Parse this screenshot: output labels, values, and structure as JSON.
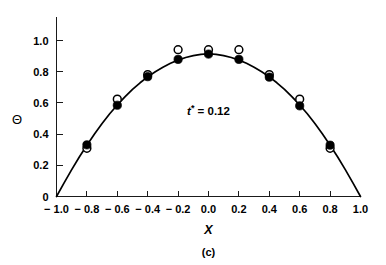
{
  "figure": {
    "caption": "(c)",
    "annotation": {
      "symbol": "t",
      "superscript": "*",
      "relation": "=",
      "value": "0.12",
      "full_text": "t* = 0.12"
    }
  },
  "chart_data": {
    "type": "scatter",
    "title": "",
    "subtitle": "",
    "xlabel": "X",
    "ylabel": "Θ",
    "xlim": [
      -1.0,
      1.0
    ],
    "ylim": [
      0.0,
      1.0
    ],
    "xticks": [
      -1.0,
      -0.8,
      -0.6,
      -0.4,
      -0.2,
      0.0,
      0.2,
      0.4,
      0.6,
      0.8,
      1.0
    ],
    "xtick_labels": [
      "− 1.0",
      "− 0.8",
      "− 0.6",
      "− 0.4",
      "− 0.2",
      "0.0",
      "0.2",
      "0.4",
      "0.6",
      "0.8",
      "1.0"
    ],
    "yticks": [
      0.0,
      0.2,
      0.4,
      0.6,
      0.8,
      1.0
    ],
    "ytick_labels": [
      "0",
      "0.2",
      "0.4",
      "0.6",
      "0.8",
      "1.0"
    ],
    "grid": false,
    "legend": "none",
    "annotations": [
      {
        "text": "t* = 0.12",
        "x": 0.0,
        "y": 0.52
      }
    ],
    "series": [
      {
        "name": "model-curve",
        "type": "line",
        "marker": "none",
        "color": "#000000",
        "x": [
          -1.0,
          -0.95,
          -0.9,
          -0.85,
          -0.8,
          -0.75,
          -0.7,
          -0.65,
          -0.6,
          -0.55,
          -0.5,
          -0.45,
          -0.4,
          -0.35,
          -0.3,
          -0.25,
          -0.2,
          -0.15,
          -0.1,
          -0.05,
          0.0,
          0.05,
          0.1,
          0.15,
          0.2,
          0.25,
          0.3,
          0.35,
          0.4,
          0.45,
          0.5,
          0.55,
          0.6,
          0.65,
          0.7,
          0.75,
          0.8,
          0.85,
          0.9,
          0.95,
          1.0
        ],
        "y": [
          0.0,
          0.087,
          0.172,
          0.253,
          0.329,
          0.401,
          0.468,
          0.53,
          0.587,
          0.639,
          0.687,
          0.729,
          0.767,
          0.8,
          0.829,
          0.854,
          0.874,
          0.891,
          0.903,
          0.911,
          0.915,
          0.911,
          0.903,
          0.891,
          0.874,
          0.854,
          0.829,
          0.8,
          0.767,
          0.729,
          0.687,
          0.639,
          0.587,
          0.53,
          0.468,
          0.401,
          0.329,
          0.253,
          0.172,
          0.087,
          0.0
        ]
      },
      {
        "name": "filled-circles",
        "type": "scatter",
        "marker": "filled-circle",
        "color": "#000000",
        "x": [
          -0.8,
          -0.6,
          -0.4,
          -0.2,
          0.0,
          0.2,
          0.4,
          0.6,
          0.8
        ],
        "y": [
          0.331,
          0.585,
          0.768,
          0.879,
          0.913,
          0.879,
          0.765,
          0.581,
          0.329
        ]
      },
      {
        "name": "open-circles",
        "type": "scatter",
        "marker": "open-circle",
        "color": "#000000",
        "x": [
          -0.8,
          -0.6,
          -0.4,
          -0.2,
          0.0,
          0.2,
          0.4,
          0.6,
          0.8
        ],
        "y": [
          0.309,
          0.624,
          0.781,
          0.941,
          0.941,
          0.941,
          0.781,
          0.624,
          0.309
        ]
      }
    ]
  }
}
